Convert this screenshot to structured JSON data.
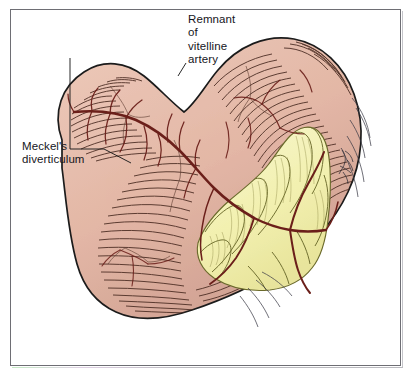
{
  "figure": {
    "kind": "anatomical-illustration",
    "background_color": "#ffffff",
    "frame_color": "#6e6e74"
  },
  "labels": {
    "vitelline": {
      "lines": [
        "Remnant",
        "of",
        "vitelline",
        "artery"
      ],
      "text": "Remnant\nof\nvitelline\nartery"
    },
    "meckel": {
      "lines": [
        "Meckel's",
        "diverticulum"
      ],
      "text": "Meckel's\ndiverticulum"
    }
  },
  "palette": {
    "bowel_fill": "#e3b7a6",
    "bowel_fill_light": "#ecc8b8",
    "bowel_fill_shadow": "#cfa091",
    "bowel_outline": "#1c1c1c",
    "haustra_line": "#4a2b22",
    "mesentery_fill": "#f2f0b0",
    "mesentery_fill_light": "#f7f6cc",
    "mesentery_outline": "#6b6a2c",
    "vessel_dark_red": "#6b1f1a",
    "vessel_mid_red": "#7d2a22",
    "leader_line": "#1c1c1c",
    "text_color": "#16161c"
  }
}
